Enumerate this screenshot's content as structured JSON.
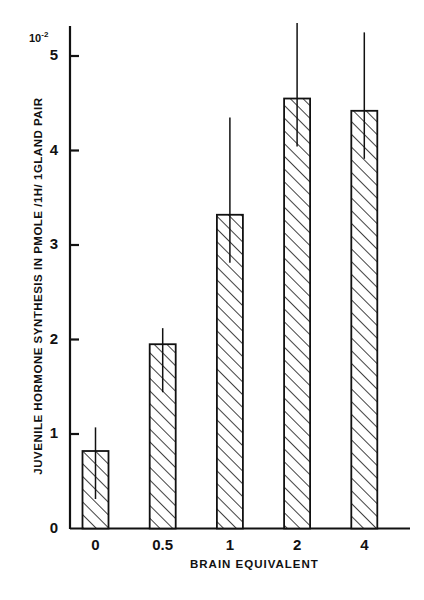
{
  "chart_data": {
    "type": "bar",
    "title": "",
    "subtitle": "",
    "xlabel": "BRAIN  EQUIVALENT",
    "ylabel": "JUVENILE  HORMONE  SYNTHESIS  IN  PMOLE /1H/ 1GLAND  PAIR",
    "y_multiplier": "10",
    "y_multiplier_exponent": "-2",
    "categories": [
      "0",
      "0.5",
      "1",
      "2",
      "4"
    ],
    "values": [
      0.82,
      1.95,
      3.32,
      4.55,
      4.42
    ],
    "error_upper": [
      1.07,
      2.12,
      4.35,
      5.35,
      5.25
    ],
    "ylim": [
      0,
      5.3
    ],
    "yticks": [
      "0",
      "1",
      "2",
      "3",
      "4",
      "5"
    ],
    "ytick_values": [
      0,
      1,
      2,
      3,
      4,
      5
    ],
    "grid": false,
    "legend": false,
    "bar_fill": "hatched-diagonal",
    "bar_color": "#ffffff",
    "line_color": "#111111",
    "background": "#ffffff"
  }
}
